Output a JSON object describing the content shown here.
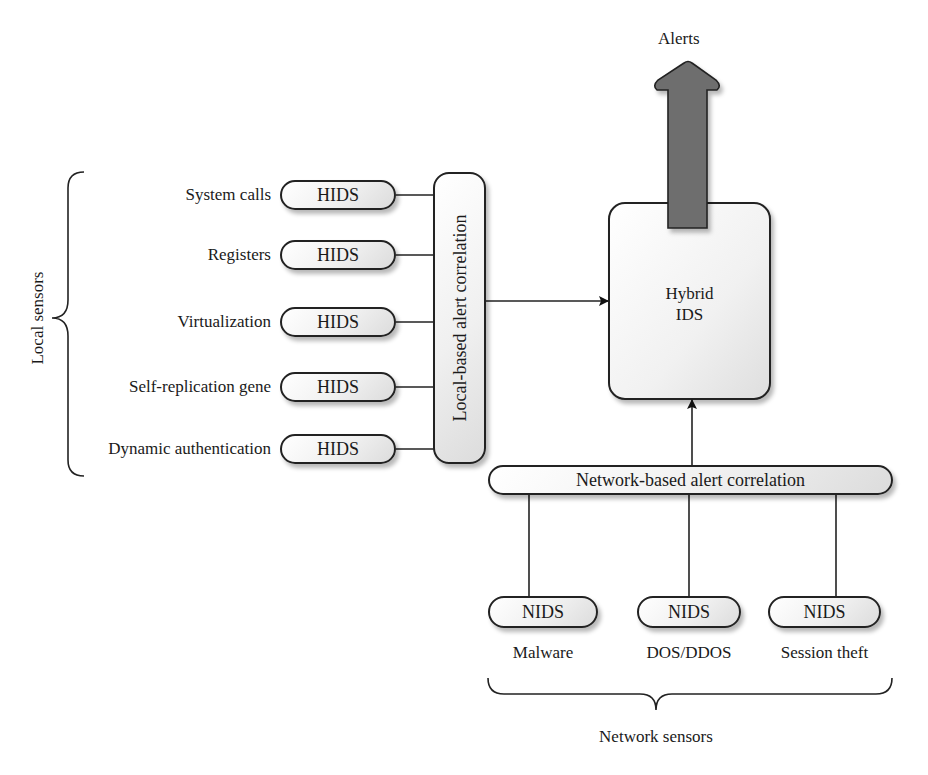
{
  "diagram": {
    "output": {
      "label": "Alerts",
      "arrow_color": "#6e6e6e"
    },
    "hybrid_ids": {
      "line1": "Hybrid",
      "line2": "IDS"
    },
    "local_group": {
      "brace_label": "Local sensors",
      "correlation_label": "Local-based alert correlation",
      "sensors": [
        {
          "source": "System calls",
          "box": "HIDS"
        },
        {
          "source": "Registers",
          "box": "HIDS"
        },
        {
          "source": "Virtualization",
          "box": "HIDS"
        },
        {
          "source": "Self-replication gene",
          "box": "HIDS"
        },
        {
          "source": "Dynamic authentication",
          "box": "HIDS"
        }
      ]
    },
    "network_group": {
      "brace_label": "Network sensors",
      "correlation_label": "Network-based alert correlation",
      "sensors": [
        {
          "box": "NIDS",
          "source": "Malware"
        },
        {
          "box": "NIDS",
          "source": "DOS/DDOS"
        },
        {
          "box": "NIDS",
          "source": "Session theft"
        }
      ]
    }
  }
}
